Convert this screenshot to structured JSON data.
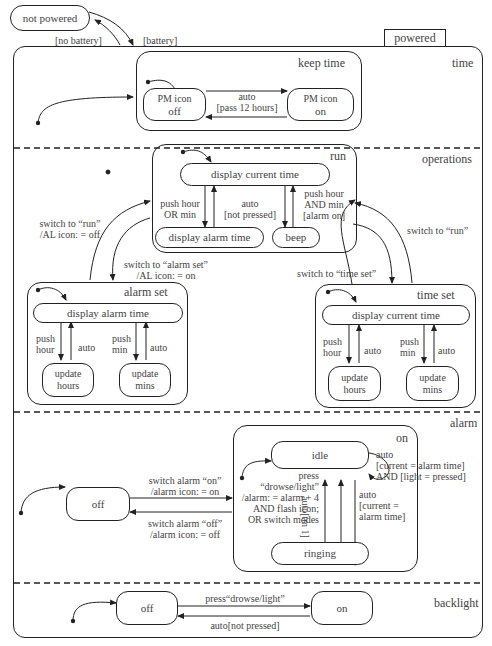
{
  "top": {
    "not_powered": "not powered",
    "no_battery": "[no battery]",
    "battery": "[battery]",
    "powered_tab": "powered"
  },
  "regions": {
    "time": "time",
    "operations": "operations",
    "alarm": "alarm",
    "backlight": "backlight"
  },
  "keep_time": {
    "title": "keep time",
    "pm_off_line1": "PM icon",
    "pm_off_line2": "off",
    "pm_on_line1": "PM icon",
    "pm_on_line2": "on",
    "trans_line1": "auto",
    "trans_line2": "[pass 12 hours]"
  },
  "run": {
    "title": "run",
    "display_current": "display current time",
    "display_alarm": "display alarm time",
    "beep": "beep",
    "push_or_1": "push hour",
    "push_or_2": "OR min",
    "auto_1": "auto",
    "auto_2": "[not pressed]",
    "push_and_1": "push hour",
    "push_and_2": "AND min",
    "push_and_3": "[alarm on]"
  },
  "operations_transitions": {
    "to_run_left_1": "switch to “run”",
    "to_run_left_2": "/AL icon: = off",
    "to_alarm_set_1": "switch to “alarm set”",
    "to_alarm_set_2": "/AL icon: = on",
    "to_run_right": "switch to “run”",
    "to_time_set": "switch to “time set”"
  },
  "alarm_set": {
    "title": "alarm set",
    "display": "display alarm time",
    "push_hour_1": "push",
    "push_hour_2": "hour",
    "auto_a": "auto",
    "push_min_1": "push",
    "push_min_2": "min",
    "auto_b": "auto",
    "update_hours_1": "update",
    "update_hours_2": "hours",
    "update_mins_1": "update",
    "update_mins_2": "mins"
  },
  "time_set": {
    "title": "time set",
    "display": "display current time",
    "push_hour_1": "push",
    "push_hour_2": "hour",
    "auto_a": "auto",
    "push_min_1": "push",
    "push_min_2": "min",
    "auto_b": "auto",
    "update_hours_1": "update",
    "update_hours_2": "hours",
    "update_mins_1": "update",
    "update_mins_2": "mins"
  },
  "alarm": {
    "off": "off",
    "on_title": "on",
    "idle": "idle",
    "ringing": "ringing",
    "switch_on_1": "switch alarm “on”",
    "switch_on_2": "/alarm icon: = on",
    "switch_off_1": "switch alarm “off”",
    "switch_off_2": "/alarm icon: = off",
    "press_1": "press",
    "press_2": "“drowse/light”",
    "press_3": "/alarm: = alarm + 4",
    "press_4": "AND flash icon;",
    "press_5": "OR switch modes",
    "auto_tm": "auto[tm 1]",
    "self_1": "auto",
    "self_2": "[current = alarm time]",
    "self_3": "AND [light = pressed]",
    "ring_1": "auto",
    "ring_2": "[current =",
    "ring_3": "alarm time]"
  },
  "backlight": {
    "off": "off",
    "on": "on",
    "press": "press“drowse/light”",
    "auto": "auto[not pressed]"
  }
}
